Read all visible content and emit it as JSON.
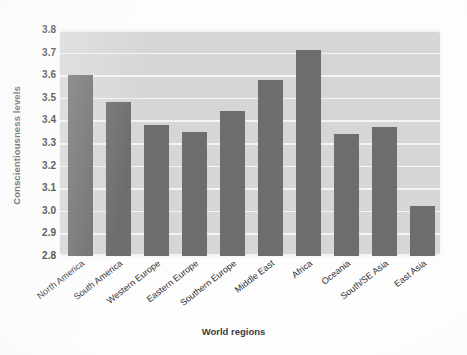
{
  "chart_data": {
    "type": "bar",
    "title": "",
    "xlabel": "World regions",
    "ylabel": "Conscientiousness levels",
    "categories": [
      "North America",
      "South America",
      "Western Europe",
      "Eastern Europe",
      "Southern Europe",
      "Middle East",
      "Africa",
      "Oceania",
      "South/SE Asia",
      "East Asia"
    ],
    "values": [
      3.6,
      3.48,
      3.38,
      3.35,
      3.44,
      3.58,
      3.71,
      3.34,
      3.37,
      3.02
    ],
    "ylim": [
      2.8,
      3.8
    ],
    "ytick_labels": [
      "3.8",
      "3.7",
      "3.6",
      "3.5",
      "3.4",
      "3.3",
      "3.2",
      "3.1",
      "3.0",
      "2.9",
      "2.8"
    ],
    "ytick_values": [
      3.8,
      3.7,
      3.6,
      3.5,
      3.4,
      3.3,
      3.2,
      3.1,
      3.0,
      2.9,
      2.8
    ],
    "grid": true,
    "legend": "none",
    "bar_color": "#6d6d6d",
    "plot_background": "#d6d6d6",
    "gridline_color": "#f4f4f4",
    "figure_background": "#fdfdfd"
  }
}
